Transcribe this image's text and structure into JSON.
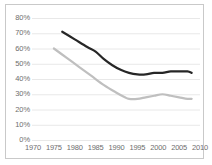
{
  "chart_data": {
    "type": "line",
    "title": "",
    "subtitle": "",
    "xlabel": "",
    "ylabel": "",
    "xlim": [
      1970,
      2010
    ],
    "ylim": [
      0,
      0.8
    ],
    "grid": true,
    "legend_position": "none",
    "x_tick_labels": [
      "1970",
      "1975",
      "1980",
      "1985",
      "1990",
      "1995",
      "2000",
      "2005",
      "2010"
    ],
    "x_ticks": [
      1970,
      1975,
      1980,
      1985,
      1990,
      1995,
      2000,
      2005,
      2010
    ],
    "y_tick_labels": [
      "0%",
      "10%",
      "20%",
      "30%",
      "40%",
      "50%",
      "60%",
      "70%",
      "80%"
    ],
    "y_ticks": [
      0,
      10,
      20,
      30,
      40,
      50,
      60,
      70,
      80
    ],
    "y_unit": "%",
    "series": [
      {
        "name": "series-dark",
        "color": "#262626",
        "x": [
          1977,
          1980,
          1983,
          1985,
          1987,
          1989,
          1991,
          1993,
          1995,
          1997,
          1999,
          2001,
          2003,
          2005,
          2007,
          2008
        ],
        "values": [
          71,
          66,
          61,
          58,
          53,
          49,
          46,
          44,
          43,
          43,
          44,
          44,
          45,
          45,
          45,
          44
        ]
      },
      {
        "name": "series-light",
        "color": "#bfbfbf",
        "x": [
          1975,
          1978,
          1981,
          1984,
          1987,
          1990,
          1992,
          1993,
          1995,
          1997,
          1999,
          2001,
          2003,
          2005,
          2007,
          2008
        ],
        "values": [
          60,
          54,
          48,
          42,
          36,
          31,
          28,
          27,
          27,
          28,
          29,
          30,
          29,
          28,
          27,
          27
        ]
      }
    ]
  },
  "axes": {
    "y_tick_labels": [
      "80%",
      "70%",
      "60%",
      "50%",
      "40%",
      "30%",
      "20%",
      "10%",
      "0%"
    ],
    "x_tick_labels": [
      "1970",
      "1975",
      "1980",
      "1985",
      "1990",
      "1995",
      "2000",
      "2005",
      "2010"
    ]
  },
  "colors": {
    "frame": "#c9c9c9",
    "gridline": "#e8e8e8",
    "series_dark": "#262626",
    "series_light": "#bfbfbf",
    "tick_text": "#6e6e6e",
    "background": "#ffffff"
  }
}
